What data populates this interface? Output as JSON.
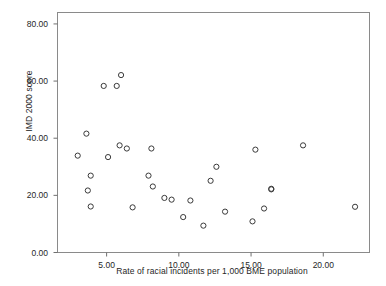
{
  "chart_data": {
    "type": "scatter",
    "title": "",
    "xlabel": "Rate of racial incidents per 1,000 BME population",
    "ylabel": "IMD 2000 score",
    "xlim": [
      1.6,
      23.2
    ],
    "ylim": [
      0,
      84
    ],
    "grid": false,
    "legend": null,
    "xticks": [
      5.0,
      10.0,
      15.0,
      20.0
    ],
    "xtick_labels": [
      "5.00",
      "10.00",
      "15.00",
      "20.00"
    ],
    "yticks": [
      0.0,
      20.0,
      40.0,
      60.0,
      80.0
    ],
    "ytick_labels": [
      "0.00",
      "20.00",
      "40.00",
      "60.00",
      "80.00"
    ],
    "marker": "open-circle",
    "marker_color": "#3a3a3a",
    "points": [
      {
        "x": 6.0,
        "y": 62.1
      },
      {
        "x": 4.8,
        "y": 58.3
      },
      {
        "x": 5.7,
        "y": 58.3
      },
      {
        "x": 3.6,
        "y": 41.6
      },
      {
        "x": 3.0,
        "y": 33.9
      },
      {
        "x": 5.9,
        "y": 37.5
      },
      {
        "x": 6.4,
        "y": 36.4
      },
      {
        "x": 5.1,
        "y": 33.4
      },
      {
        "x": 8.1,
        "y": 36.4
      },
      {
        "x": 3.9,
        "y": 26.9
      },
      {
        "x": 7.9,
        "y": 26.9
      },
      {
        "x": 3.7,
        "y": 21.7
      },
      {
        "x": 8.2,
        "y": 23.1
      },
      {
        "x": 3.9,
        "y": 16.1
      },
      {
        "x": 6.8,
        "y": 15.8
      },
      {
        "x": 9.0,
        "y": 19.1
      },
      {
        "x": 9.5,
        "y": 18.5
      },
      {
        "x": 10.8,
        "y": 18.2
      },
      {
        "x": 10.3,
        "y": 12.4
      },
      {
        "x": 11.7,
        "y": 9.4
      },
      {
        "x": 12.2,
        "y": 25.1
      },
      {
        "x": 12.6,
        "y": 30.0
      },
      {
        "x": 13.2,
        "y": 14.3
      },
      {
        "x": 15.1,
        "y": 10.9
      },
      {
        "x": 15.3,
        "y": 36.0
      },
      {
        "x": 15.9,
        "y": 15.4
      },
      {
        "x": 16.4,
        "y": 22.1
      },
      {
        "x": 16.4,
        "y": 22.3
      },
      {
        "x": 18.6,
        "y": 37.5
      },
      {
        "x": 22.2,
        "y": 16.0
      }
    ]
  },
  "axes": {
    "y_axis_title": "IMD 2000 score",
    "x_axis_title": "Rate of racial incidents per 1,000 BME population"
  }
}
